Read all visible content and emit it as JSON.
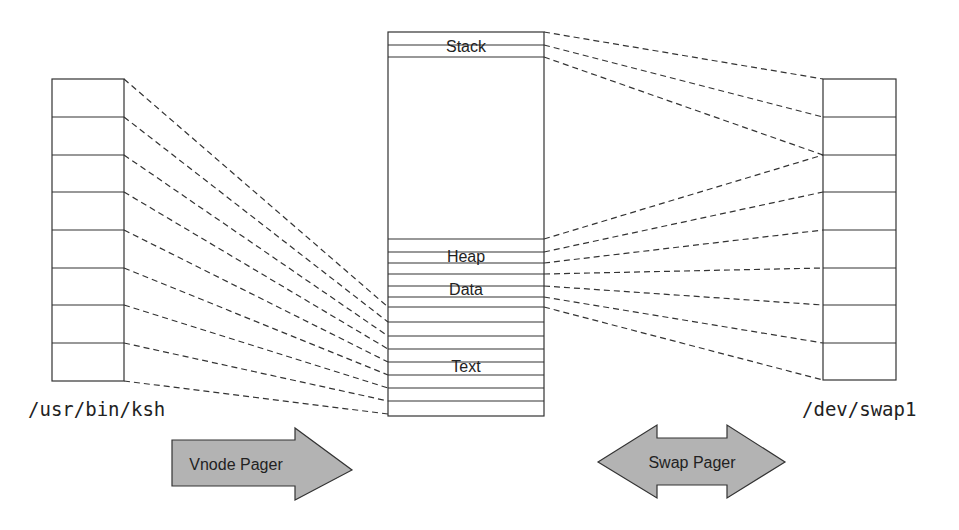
{
  "diagram": {
    "type": "memory-mapping",
    "left_object": {
      "label": "/usr/bin/ksh",
      "pages": 8
    },
    "right_object": {
      "label": "/dev/swap1",
      "pages": 8
    },
    "address_space": {
      "segments": [
        {
          "label": "Stack"
        },
        {
          "label": "Heap"
        },
        {
          "label": "Data"
        },
        {
          "label": "Text"
        }
      ]
    },
    "pagers": [
      {
        "label": "Vnode Pager",
        "direction": "right"
      },
      {
        "label": "Swap Pager",
        "direction": "both"
      }
    ],
    "colors": {
      "line": "#333333",
      "arrow_fill": "#b3b3b3",
      "background": "#ffffff"
    }
  }
}
